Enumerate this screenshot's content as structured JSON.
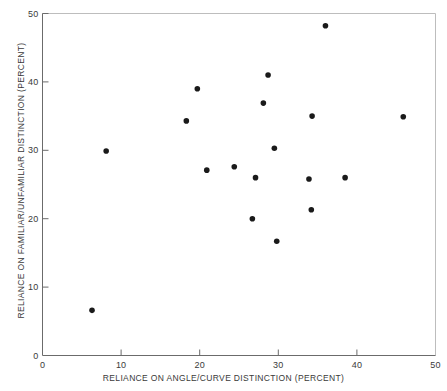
{
  "chart_data": {
    "type": "scatter",
    "title": "",
    "xlabel": "RELIANCE ON ANGLE/CURVE DISTINCTION (PERCENT)",
    "ylabel": "RELIANCE ON FAMILIAR/UNFAMILIAR DISTINCTION (PERCENT)",
    "xlim": [
      0,
      50
    ],
    "ylim": [
      0,
      50
    ],
    "xticks": [
      0,
      10,
      20,
      30,
      40,
      50
    ],
    "yticks": [
      0,
      10,
      20,
      30,
      40,
      50
    ],
    "xticklabels": [
      "0",
      "10",
      "20",
      "30",
      "40",
      "50"
    ],
    "yticklabels": [
      "0",
      "10",
      "20",
      "30",
      "40",
      "50"
    ],
    "grid": false,
    "legend": null,
    "marker": {
      "shape": "circle",
      "color": "#1a1a1a",
      "size_px": 5.6
    },
    "axis_color": "#6b6b6b",
    "background_color": "#ffffff",
    "points": [
      {
        "x": 6.3,
        "y": 6.6
      },
      {
        "x": 8.1,
        "y": 29.9
      },
      {
        "x": 18.3,
        "y": 34.3
      },
      {
        "x": 19.7,
        "y": 39.0
      },
      {
        "x": 20.9,
        "y": 27.1
      },
      {
        "x": 24.4,
        "y": 27.6
      },
      {
        "x": 26.7,
        "y": 20.0
      },
      {
        "x": 27.1,
        "y": 26.0
      },
      {
        "x": 28.1,
        "y": 36.9
      },
      {
        "x": 28.7,
        "y": 41.0
      },
      {
        "x": 29.5,
        "y": 30.3
      },
      {
        "x": 29.8,
        "y": 16.7
      },
      {
        "x": 33.9,
        "y": 25.8
      },
      {
        "x": 34.2,
        "y": 21.3
      },
      {
        "x": 34.3,
        "y": 35.0
      },
      {
        "x": 36.0,
        "y": 48.2
      },
      {
        "x": 38.5,
        "y": 26.0
      },
      {
        "x": 45.9,
        "y": 34.9
      }
    ]
  }
}
